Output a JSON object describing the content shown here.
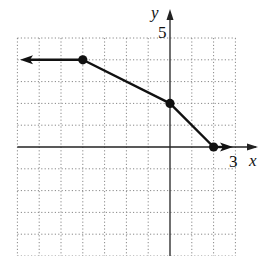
{
  "chart_data": {
    "type": "line",
    "title": "",
    "xlabel": "x",
    "ylabel": "y",
    "xlim": [
      -7,
      3
    ],
    "ylim": [
      -4,
      5
    ],
    "grid": true,
    "grid_style": "dotted",
    "tick_labels": {
      "x": [
        {
          "value": 3,
          "label": "3"
        }
      ],
      "y": [
        {
          "value": 5,
          "label": "5"
        }
      ]
    },
    "series": [
      {
        "name": "piecewise function",
        "points": [
          {
            "x": -4,
            "y": 4,
            "marker": "closed-dot"
          },
          {
            "x": 0,
            "y": 2,
            "marker": "closed-dot"
          },
          {
            "x": 2,
            "y": 0,
            "marker": "closed-dot"
          }
        ],
        "extends_left": {
          "from": {
            "x": -4,
            "y": 4
          },
          "direction": "horizontal",
          "arrow": true
        },
        "extends_right": {
          "from": {
            "x": 2,
            "y": 0
          },
          "direction": "horizontal",
          "arrow": true
        }
      }
    ],
    "legend": null
  },
  "labels": {
    "x_axis": "x",
    "y_axis": "y",
    "x_tick_3": "3",
    "y_tick_5": "5"
  },
  "colors": {
    "line": "#111111",
    "grid": "#888888",
    "axis": "#222222"
  }
}
